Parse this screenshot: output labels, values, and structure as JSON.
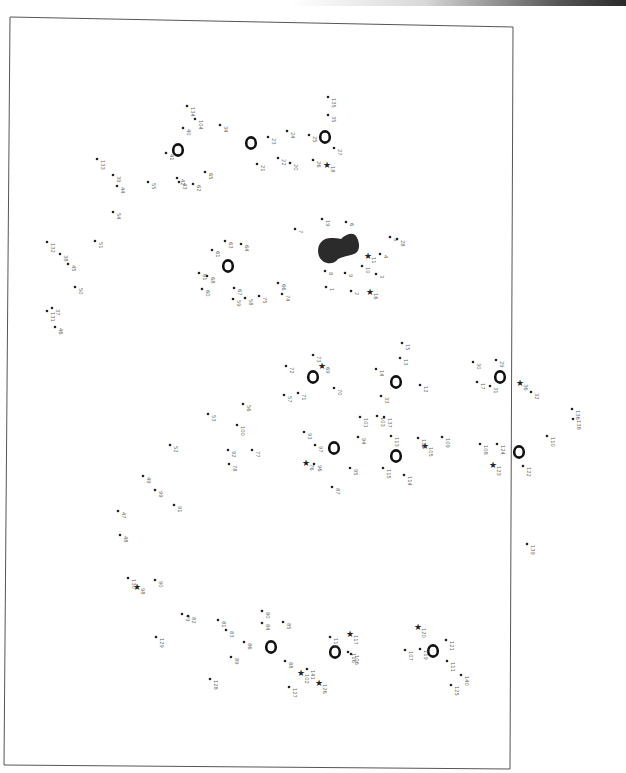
{
  "page": {
    "type": "connect-the-dots puzzle",
    "orientation": "rotated 90deg (labels read bottom-to-top)"
  },
  "dots": [
    {
      "n": "1",
      "marker": "dot"
    },
    {
      "n": "2",
      "marker": "dot"
    },
    {
      "n": "3",
      "marker": "dot"
    },
    {
      "n": "4",
      "marker": "dot"
    },
    {
      "n": "5",
      "marker": "dot"
    },
    {
      "n": "6",
      "marker": "dot"
    },
    {
      "n": "7",
      "marker": "dot"
    },
    {
      "n": "8",
      "marker": "dot"
    },
    {
      "n": "9",
      "marker": "dot"
    },
    {
      "n": "10",
      "marker": "dot"
    },
    {
      "n": "11",
      "marker": "star"
    },
    {
      "n": "12",
      "marker": "dot"
    },
    {
      "n": "13",
      "marker": "dot"
    },
    {
      "n": "14",
      "marker": "dot"
    },
    {
      "n": "15",
      "marker": "dot"
    },
    {
      "n": "16",
      "marker": "star"
    },
    {
      "n": "17",
      "marker": "dot"
    },
    {
      "n": "18",
      "marker": "star"
    },
    {
      "n": "19",
      "marker": "dot"
    },
    {
      "n": "20",
      "marker": "dot"
    },
    {
      "n": "21",
      "marker": "dot"
    },
    {
      "n": "22",
      "marker": "dot"
    },
    {
      "n": "23",
      "marker": "dot"
    },
    {
      "n": "24",
      "marker": "dot"
    },
    {
      "n": "25",
      "marker": "dot"
    },
    {
      "n": "26",
      "marker": "dot"
    },
    {
      "n": "27",
      "marker": "dot"
    },
    {
      "n": "28",
      "marker": "dot"
    },
    {
      "n": "29",
      "marker": "dot"
    },
    {
      "n": "30",
      "marker": "dot"
    },
    {
      "n": "31",
      "marker": "dot"
    },
    {
      "n": "32",
      "marker": "dot"
    },
    {
      "n": "33",
      "marker": "dot"
    },
    {
      "n": "34",
      "marker": "dot"
    },
    {
      "n": "35",
      "marker": "dot"
    },
    {
      "n": "36",
      "marker": "star"
    },
    {
      "n": "37",
      "marker": "dot"
    },
    {
      "n": "38",
      "marker": "dot"
    },
    {
      "n": "39",
      "marker": "dot"
    },
    {
      "n": "40",
      "marker": "dot"
    },
    {
      "n": "41",
      "marker": "dot"
    },
    {
      "n": "42",
      "marker": "dot"
    },
    {
      "n": "43",
      "marker": "dot"
    },
    {
      "n": "44",
      "marker": "dot"
    },
    {
      "n": "45",
      "marker": "dot"
    },
    {
      "n": "46",
      "marker": "dot"
    },
    {
      "n": "47",
      "marker": "dot"
    },
    {
      "n": "48",
      "marker": "dot"
    },
    {
      "n": "49",
      "marker": "dot"
    },
    {
      "n": "50",
      "marker": "dot"
    },
    {
      "n": "51",
      "marker": "dot"
    },
    {
      "n": "52",
      "marker": "dot"
    },
    {
      "n": "53",
      "marker": "dot"
    },
    {
      "n": "54",
      "marker": "dot"
    },
    {
      "n": "55",
      "marker": "dot"
    },
    {
      "n": "56",
      "marker": "dot"
    },
    {
      "n": "57",
      "marker": "dot"
    },
    {
      "n": "58",
      "marker": "dot"
    },
    {
      "n": "59",
      "marker": "dot"
    },
    {
      "n": "60",
      "marker": "dot"
    },
    {
      "n": "61",
      "marker": "dot"
    },
    {
      "n": "61",
      "marker": "dot"
    },
    {
      "n": "62",
      "marker": "dot"
    },
    {
      "n": "63",
      "marker": "dot"
    },
    {
      "n": "64",
      "marker": "dot"
    },
    {
      "n": "65",
      "marker": "dot"
    },
    {
      "n": "66",
      "marker": "dot"
    },
    {
      "n": "67",
      "marker": "dot"
    },
    {
      "n": "68",
      "marker": "dot"
    },
    {
      "n": "69",
      "marker": "star"
    },
    {
      "n": "70",
      "marker": "dot"
    },
    {
      "n": "71",
      "marker": "dot"
    },
    {
      "n": "72",
      "marker": "dot"
    },
    {
      "n": "73",
      "marker": "dot"
    },
    {
      "n": "74",
      "marker": "dot"
    },
    {
      "n": "75",
      "marker": "dot"
    },
    {
      "n": "76",
      "marker": "star"
    },
    {
      "n": "77",
      "marker": "dot"
    },
    {
      "n": "78",
      "marker": "dot"
    },
    {
      "n": "79",
      "marker": "dot"
    },
    {
      "n": "80",
      "marker": "dot"
    },
    {
      "n": "81",
      "marker": "dot"
    },
    {
      "n": "82",
      "marker": "dot"
    },
    {
      "n": "83",
      "marker": "dot"
    },
    {
      "n": "84",
      "marker": "dot"
    },
    {
      "n": "85",
      "marker": "dot"
    },
    {
      "n": "86",
      "marker": "dot"
    },
    {
      "n": "87",
      "marker": "dot"
    },
    {
      "n": "88",
      "marker": "dot"
    },
    {
      "n": "89",
      "marker": "dot"
    },
    {
      "n": "90",
      "marker": "dot"
    },
    {
      "n": "91",
      "marker": "dot"
    },
    {
      "n": "92",
      "marker": "dot"
    },
    {
      "n": "93",
      "marker": "dot"
    },
    {
      "n": "94",
      "marker": "dot"
    },
    {
      "n": "95",
      "marker": "dot"
    },
    {
      "n": "96",
      "marker": "dot"
    },
    {
      "n": "97",
      "marker": "dot"
    },
    {
      "n": "98",
      "marker": "star"
    },
    {
      "n": "99",
      "marker": "dot"
    },
    {
      "n": "100",
      "marker": "dot"
    },
    {
      "n": "101",
      "marker": "dot"
    },
    {
      "n": "102",
      "marker": "star"
    },
    {
      "n": "103",
      "marker": "dot"
    },
    {
      "n": "104",
      "marker": "dot"
    },
    {
      "n": "105",
      "marker": "star"
    },
    {
      "n": "106",
      "marker": "dot"
    },
    {
      "n": "107",
      "marker": "dot"
    },
    {
      "n": "108",
      "marker": "dot"
    },
    {
      "n": "109",
      "marker": "dot"
    },
    {
      "n": "110",
      "marker": "dot"
    },
    {
      "n": "111",
      "marker": "dot"
    },
    {
      "n": "112",
      "marker": "dot"
    },
    {
      "n": "113",
      "marker": "dot"
    },
    {
      "n": "114",
      "marker": "dot"
    },
    {
      "n": "115",
      "marker": "dot"
    },
    {
      "n": "116",
      "marker": "dot"
    },
    {
      "n": "117",
      "marker": "star"
    },
    {
      "n": "118",
      "marker": "dot"
    },
    {
      "n": "119",
      "marker": "dot"
    },
    {
      "n": "120",
      "marker": "star"
    },
    {
      "n": "121",
      "marker": "dot"
    },
    {
      "n": "122",
      "marker": "dot"
    },
    {
      "n": "123",
      "marker": "star"
    },
    {
      "n": "124",
      "marker": "dot"
    },
    {
      "n": "125",
      "marker": "dot"
    },
    {
      "n": "126",
      "marker": "star"
    },
    {
      "n": "127",
      "marker": "dot"
    },
    {
      "n": "128",
      "marker": "dot"
    },
    {
      "n": "129",
      "marker": "dot"
    },
    {
      "n": "130",
      "marker": "dot"
    },
    {
      "n": "131",
      "marker": "dot"
    },
    {
      "n": "132",
      "marker": "dot"
    },
    {
      "n": "133",
      "marker": "dot"
    },
    {
      "n": "134",
      "marker": "dot"
    },
    {
      "n": "135",
      "marker": "dot"
    },
    {
      "n": "136",
      "marker": "dot"
    },
    {
      "n": "137",
      "marker": "dot"
    },
    {
      "n": "138",
      "marker": "dot"
    },
    {
      "n": "139",
      "marker": "dot"
    },
    {
      "n": "140",
      "marker": "dot"
    },
    {
      "n": "141",
      "marker": "dot"
    },
    {
      "n": "142",
      "marker": "star"
    },
    {
      "n": "113",
      "marker": "dot"
    }
  ],
  "shapes": {
    "rings": [
      "ring",
      "ring",
      "ring",
      "ring",
      "ring",
      "ring",
      "ring",
      "ring",
      "ring",
      "ring",
      "ring",
      "ring",
      "ring"
    ],
    "blob": "filled-head-shape"
  }
}
